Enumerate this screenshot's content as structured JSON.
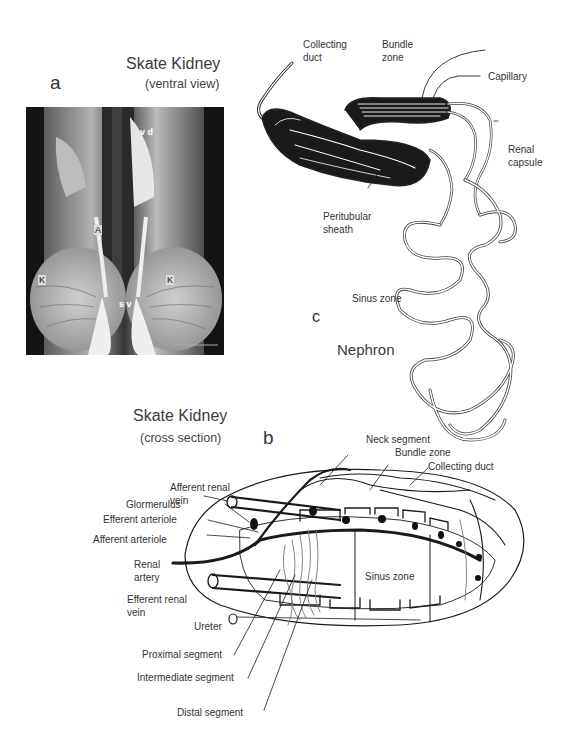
{
  "panel_a": {
    "letter": "a",
    "title": "Skate Kidney",
    "subtitle": "(ventral view)",
    "photo_labels": {
      "vd": "v d",
      "A": "A",
      "K_left": "K",
      "K_right": "K",
      "sv": "s v"
    }
  },
  "panel_c": {
    "letter": "c",
    "title": "Nephron",
    "labels": {
      "collecting_duct_1": "Collecting",
      "collecting_duct_2": "duct",
      "bundle_zone_1": "Bundle",
      "bundle_zone_2": "zone",
      "capillary": "Capillary",
      "renal_capsule_1": "Renal",
      "renal_capsule_2": "capsule",
      "peritubular_sheath_1": "Peritubular",
      "peritubular_sheath_2": "sheath",
      "sinus_zone": "Sinus zone"
    }
  },
  "panel_b": {
    "letter": "b",
    "title": "Skate Kidney",
    "subtitle": "(cross section)",
    "labels": {
      "afferent_renal_vein_1": "Afferent renal",
      "afferent_renal_vein_2": "vein",
      "glomerulus": "Glormerulus",
      "efferent_arteriole": "Efferent arteriole",
      "afferent_arteriole": "Afferent arteriole",
      "renal_artery_1": "Renal",
      "renal_artery_2": "artery",
      "efferent_renal_vein_1": "Efferent renal",
      "efferent_renal_vein_2": "vein",
      "ureter": "Ureter",
      "proximal_segment": "Proximal segment",
      "intermediate_segment": "Intermediate segment",
      "distal_segment": "Distal segment",
      "neck_segment": "Neck segment",
      "bundle_zone": "Bundle zone",
      "collecting_duct": "Collecting duct",
      "sinus_zone": "Sinus zone"
    }
  }
}
